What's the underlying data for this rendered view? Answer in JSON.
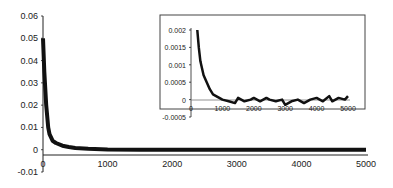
{
  "chart_data": [
    {
      "type": "line",
      "title": "",
      "xlabel": "",
      "ylabel": "",
      "xlim": [
        0,
        5000
      ],
      "ylim": [
        -0.01,
        0.06
      ],
      "x_ticks": [
        "0",
        "1000",
        "2000",
        "3000",
        "4000",
        "5000"
      ],
      "y_ticks": [
        "0.06",
        "0.05",
        "0.04",
        "0.03",
        "0.02",
        "0.01",
        "0",
        "-0.01"
      ],
      "grid": false,
      "legend": null,
      "series": [
        {
          "name": "main",
          "x": [
            0,
            20,
            50,
            80,
            100,
            150,
            200,
            300,
            400,
            500,
            700,
            1000,
            1500,
            2000,
            3000,
            4000,
            5000
          ],
          "values": [
            0.05,
            0.035,
            0.02,
            0.01,
            0.007,
            0.004,
            0.003,
            0.0018,
            0.0012,
            0.0008,
            0.0004,
            0.0001,
            0.0,
            0.0,
            0.0,
            0.0,
            0.0
          ]
        }
      ]
    },
    {
      "type": "line",
      "title": "inset",
      "xlim": [
        0,
        5000
      ],
      "ylim": [
        -0.0005,
        0.002
      ],
      "x_ticks": [
        "0",
        "1000",
        "2000",
        "3000",
        "4000",
        "5000"
      ],
      "y_ticks": [
        "0.002",
        "0.0015",
        "0.001",
        "0.0005",
        "0",
        "-0.0005"
      ],
      "grid": false,
      "series": [
        {
          "name": "inset",
          "x": [
            200,
            250,
            300,
            400,
            500,
            600,
            700,
            800,
            900,
            1000,
            1200,
            1400,
            1500,
            1700,
            1900,
            2000,
            2200,
            2400,
            2500,
            2700,
            2900,
            3000,
            3200,
            3400,
            3600,
            3800,
            4000,
            4200,
            4400,
            4500,
            4700,
            4900,
            5000
          ],
          "values": [
            0.002,
            0.0015,
            0.0011,
            0.0007,
            0.0005,
            0.0003,
            0.00015,
            0.0001,
            5e-05,
            0.0,
            -5e-05,
            -0.0001,
            5e-05,
            -5e-05,
            0.0,
            5e-05,
            -5e-05,
            5e-05,
            0.0,
            -5e-05,
            0.0,
            -0.00015,
            -5e-05,
            0.0,
            -0.0001,
            0.0,
            5e-05,
            -5e-05,
            0.0001,
            -5e-05,
            5e-05,
            0.0,
            0.0001
          ]
        }
      ]
    }
  ]
}
